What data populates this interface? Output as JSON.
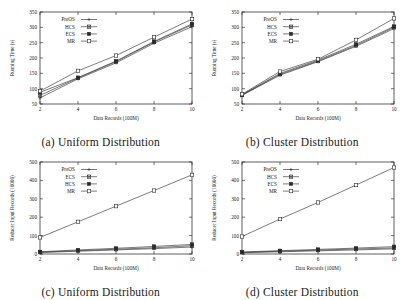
{
  "figure": {
    "panels": [
      {
        "id": "a",
        "caption": "(a)  Uniform Distribution",
        "chart_data": {
          "type": "line",
          "title": "",
          "xlabel": "Data Records (100M)",
          "ylabel": "Running Time (s)",
          "x": [
            2,
            4,
            6,
            8,
            10
          ],
          "xticks": [
            2,
            4,
            6,
            8,
            10
          ],
          "yticks": [
            50,
            100,
            150,
            200,
            250,
            300,
            350
          ],
          "xlim": [
            2,
            10
          ],
          "ylim": [
            50,
            350
          ],
          "grid": false,
          "legend_position": "top-left",
          "series": [
            {
              "name": "PreOS",
              "marker": "plus",
              "values": [
                70,
                132,
                184,
                248,
                302
              ]
            },
            {
              "name": "HCS",
              "marker": "cross-box",
              "values": [
                78,
                135,
                188,
                252,
                308
              ]
            },
            {
              "name": "ECS",
              "marker": "filled-square",
              "values": [
                88,
                136,
                190,
                254,
                311
              ]
            },
            {
              "name": "MR",
              "marker": "open-square",
              "values": [
                92,
                158,
                208,
                268,
                327
              ]
            }
          ]
        }
      },
      {
        "id": "b",
        "caption": "(b)  Cluster Distribution",
        "chart_data": {
          "type": "line",
          "title": "",
          "xlabel": "Data Records (100M)",
          "ylabel": "Running Time (s)",
          "x": [
            2,
            4,
            6,
            8,
            10
          ],
          "xticks": [
            2,
            4,
            6,
            8,
            10
          ],
          "yticks": [
            50,
            100,
            150,
            200,
            250,
            300,
            350
          ],
          "xlim": [
            2,
            10
          ],
          "ylim": [
            50,
            350
          ],
          "grid": false,
          "legend_position": "top-left",
          "series": [
            {
              "name": "PreOS",
              "marker": "plus",
              "values": [
                78,
                144,
                188,
                238,
                296
              ]
            },
            {
              "name": "HCS",
              "marker": "cross-box",
              "values": [
                79,
                147,
                190,
                241,
                300
              ]
            },
            {
              "name": "ECS",
              "marker": "filled-square",
              "values": [
                80,
                150,
                193,
                245,
                303
              ]
            },
            {
              "name": "MR",
              "marker": "open-square",
              "values": [
                82,
                156,
                196,
                259,
                329
              ]
            }
          ]
        }
      },
      {
        "id": "c",
        "caption": "(c)  Uniform Distribution",
        "chart_data": {
          "type": "line",
          "title": "",
          "xlabel": "Data Records (100M)",
          "ylabel": "Reducer Input Records (10000)",
          "x": [
            2,
            4,
            6,
            8,
            10
          ],
          "xticks": [
            2,
            4,
            6,
            8,
            10
          ],
          "yticks": [
            0,
            100,
            200,
            300,
            400,
            500
          ],
          "xlim": [
            2,
            10
          ],
          "ylim": [
            0,
            500
          ],
          "grid": false,
          "legend_position": "top-left",
          "series": [
            {
              "name": "PreOS",
              "marker": "plus",
              "values": [
                8,
                15,
                22,
                29,
                38
              ]
            },
            {
              "name": "ECS",
              "marker": "cross-box",
              "values": [
                10,
                18,
                26,
                34,
                45
              ]
            },
            {
              "name": "HCS",
              "marker": "filled-square",
              "values": [
                12,
                22,
                31,
                41,
                52
              ]
            },
            {
              "name": "MR",
              "marker": "open-square",
              "values": [
                90,
                175,
                260,
                345,
                430
              ]
            }
          ]
        }
      },
      {
        "id": "d",
        "caption": "(d)  Cluster Distribution",
        "chart_data": {
          "type": "line",
          "title": "",
          "xlabel": "Data Records (100M)",
          "ylabel": "Reducer Input Records (10000)",
          "x": [
            2,
            4,
            6,
            8,
            10
          ],
          "xticks": [
            2,
            4,
            6,
            8,
            10
          ],
          "yticks": [
            0,
            100,
            200,
            300,
            400,
            500
          ],
          "xlim": [
            2,
            10
          ],
          "ylim": [
            0,
            500
          ],
          "grid": false,
          "legend_position": "top-left",
          "series": [
            {
              "name": "PreOS",
              "marker": "plus",
              "values": [
                7,
                12,
                17,
                22,
                28
              ]
            },
            {
              "name": "HCS",
              "marker": "cross-box",
              "values": [
                9,
                15,
                21,
                27,
                33
              ]
            },
            {
              "name": "ECS",
              "marker": "filled-square",
              "values": [
                11,
                18,
                25,
                32,
                40
              ]
            },
            {
              "name": "MR",
              "marker": "open-square",
              "values": [
                95,
                190,
                280,
                375,
                470
              ]
            }
          ]
        }
      }
    ]
  },
  "style": {
    "ink": "#1a1a1a",
    "line": "#2a2a2a",
    "background": "#ffffff"
  }
}
